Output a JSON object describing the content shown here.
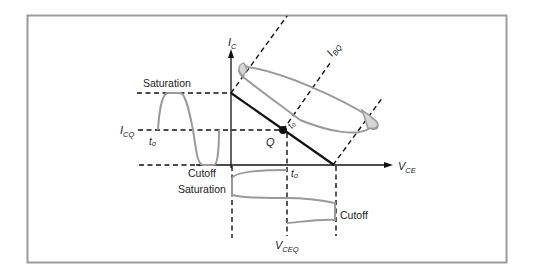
{
  "figure": {
    "axes": {
      "y_axis_label": "I",
      "y_axis_sub": "C",
      "x_axis_label": "V",
      "x_axis_sub": "CE"
    },
    "labels": {
      "saturation_top": "Saturation",
      "icq_main": "I",
      "icq_sub": "CQ",
      "t0_left": "t₀",
      "q_point": "Q",
      "t0_load": "t₀",
      "ibq_main": "I",
      "ibq_sub": "BQ",
      "cutoff_left": "Cutoff",
      "saturation_bottom": "Saturation",
      "t0_bottom": "t₀",
      "cutoff_right": "Cutoff",
      "vceq_main": "V",
      "vceq_sub": "CEQ"
    },
    "colors": {
      "frame": "#9b9b9b",
      "waveform": "#9a9a9a",
      "ellipse_fill": "#d6d6d6",
      "ink": "#111111"
    }
  }
}
